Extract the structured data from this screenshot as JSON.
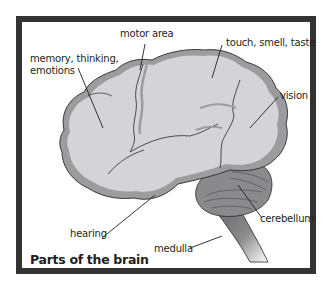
{
  "diagram": {
    "title": "Parts of the brain",
    "labels": {
      "memory": "memory, thinking,",
      "memory_line2": "emotions",
      "motor": "motor area",
      "touch": "touch, smell, taste",
      "vision": "vision",
      "hearing": "hearing",
      "cerebellum": "cerebellum",
      "medulla": "medulla"
    },
    "colors": {
      "frame": "#333333",
      "cortex_fill": "#d4d4d6",
      "cortex_shade": "#9c9c9e",
      "cerebellum_fill": "#8a8a8c",
      "stem_fill": "#7a7a7c",
      "outline": "#2a2a2a"
    }
  }
}
